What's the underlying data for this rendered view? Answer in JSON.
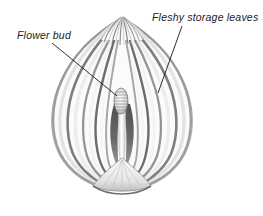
{
  "figure": {
    "type": "botanical-illustration",
    "background_color": "#ffffff",
    "ink_color": "#222222",
    "style": "grayscale pen-and-ink shaded drawing"
  },
  "labels": [
    {
      "id": "flower-bud",
      "text": "Flower bud",
      "x": 17,
      "y": 39,
      "anchor": "start",
      "leader": {
        "x1": 52,
        "y1": 43,
        "x2": 117,
        "y2": 96
      }
    },
    {
      "id": "fleshy-storage-leaves",
      "text": "Fleshy storage leaves",
      "x": 152,
      "y": 21,
      "anchor": "start",
      "leader": {
        "x1": 182,
        "y1": 26,
        "x2": 158,
        "y2": 93
      }
    }
  ],
  "palette": {
    "outline": "#6f6f6f",
    "leaf_light": "#f2f2f2",
    "leaf_mid": "#b9b9b9",
    "leaf_dark": "#6a6a6a",
    "cavity_dark": "#4a4a4a",
    "basal_plate": "#d8d8d8"
  }
}
